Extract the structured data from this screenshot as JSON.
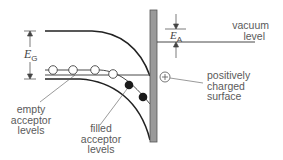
{
  "diagram": {
    "type": "semiconductor-band-diagram",
    "symbols": {
      "band_gap": {
        "main": "E",
        "sub": "G"
      },
      "electron_affinity": {
        "main": "E",
        "sub": "A"
      }
    },
    "labels": {
      "vacuum_level": [
        "vacuum",
        "level"
      ],
      "positive_surface": [
        "positively",
        "charged",
        "surface"
      ],
      "empty_acceptor": [
        "empty",
        "acceptor",
        "levels"
      ],
      "filled_acceptor": [
        "filled",
        "acceptor",
        "levels"
      ],
      "plus_sign": "+"
    },
    "colors": {
      "line": "#222222",
      "surface_bar": "#9a9a9a",
      "surface_bar_border": "#555555",
      "text": "#5a5a5a"
    },
    "empty_acceptor_circles": 4,
    "filled_acceptor_circles": 2
  }
}
